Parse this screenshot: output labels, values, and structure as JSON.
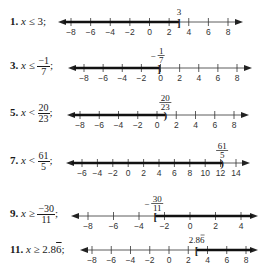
{
  "problems": [
    {
      "number": "1.",
      "variable": "x",
      "relation": "≤",
      "value_text": "3",
      "value_frac": null,
      "boundary": 3,
      "boundary_label": "3",
      "boundary_label_frac": null,
      "bracket": "]",
      "direction": "left",
      "ticks": [
        -8,
        -6,
        -4,
        -2,
        0,
        2,
        4,
        6,
        8
      ],
      "tick_labels": [
        "−8",
        "−6",
        "−4",
        "−2",
        "0",
        "2",
        "4",
        "6",
        "8"
      ]
    },
    {
      "number": "3.",
      "variable": "x",
      "relation": "≤",
      "value_text": null,
      "value_frac": {
        "num": "−1",
        "den": "7"
      },
      "boundary": -0.142857,
      "boundary_label": null,
      "boundary_label_frac": {
        "sign": "−",
        "num": "1",
        "den": "7"
      },
      "bracket": "]",
      "direction": "left",
      "ticks": [
        -8,
        -6,
        -4,
        -2,
        0,
        2,
        4,
        6,
        8
      ],
      "tick_labels": [
        "−8",
        "−6",
        "−4",
        "−2",
        "0",
        "2",
        "4",
        "6",
        "8"
      ]
    },
    {
      "number": "5.",
      "variable": "x",
      "relation": "<",
      "value_text": null,
      "value_frac": {
        "num": "20",
        "den": "23"
      },
      "boundary": 0.869565,
      "boundary_label": null,
      "boundary_label_frac": {
        "sign": "",
        "num": "20",
        "den": "23"
      },
      "bracket": ")",
      "direction": "left",
      "ticks": [
        -8,
        -6,
        -4,
        -2,
        0,
        2,
        4,
        6,
        8
      ],
      "tick_labels": [
        "−8",
        "−6",
        "−4",
        "−2",
        "0",
        "2",
        "4",
        "6",
        "8"
      ]
    },
    {
      "number": "7.",
      "variable": "x",
      "relation": "<",
      "value_text": null,
      "value_frac": {
        "num": "61",
        "den": "5"
      },
      "boundary": 12.2,
      "boundary_label": null,
      "boundary_label_frac": {
        "sign": "",
        "num": "61",
        "den": "5"
      },
      "bracket": ")",
      "direction": "left",
      "ticks": [
        -6,
        -4,
        -2,
        0,
        2,
        4,
        6,
        8,
        10,
        12,
        14
      ],
      "tick_labels": [
        "−6",
        "−4",
        "−2",
        "0",
        "2",
        "4",
        "6",
        "8",
        "10",
        "12",
        "14"
      ]
    },
    {
      "number": "9.",
      "variable": "x",
      "relation": "≥",
      "value_text": null,
      "value_frac": {
        "num": "−30",
        "den": "11"
      },
      "boundary": -2.727273,
      "boundary_label": null,
      "boundary_label_frac": {
        "sign": "−",
        "num": "30",
        "den": "11"
      },
      "bracket": "[",
      "direction": "right",
      "ticks": [
        -8,
        -6,
        -4,
        -2,
        0,
        2,
        4
      ],
      "tick_labels": [
        "−8",
        "−6",
        "−4",
        "−2",
        "0",
        "2",
        "4"
      ]
    },
    {
      "number": "11.",
      "variable": "x",
      "relation": "≥",
      "value_text": "2.86",
      "value_repeat": "6",
      "value_frac": null,
      "boundary": 2.8667,
      "boundary_label": "2.86",
      "boundary_label_frac": null,
      "bracket": "[",
      "direction": "right",
      "ticks": [
        -8,
        -6,
        -4,
        -2,
        0,
        2,
        4,
        6,
        8
      ],
      "tick_labels": [
        "−8",
        "−6",
        "−4",
        "−2",
        "0",
        "2",
        "4",
        "6",
        "8"
      ]
    }
  ],
  "layout": [
    {
      "top": 0,
      "label_left": 10,
      "label_top": 14,
      "line_y": 22,
      "x0": 58,
      "x1": 243,
      "t0": 71,
      "t1": 228
    },
    {
      "top": 45,
      "label_left": 10,
      "label_top": 50,
      "line_y": 23,
      "x0": 68,
      "x1": 252,
      "t0": 84,
      "t1": 237
    },
    {
      "top": 90,
      "label_left": 10,
      "label_top": 50,
      "line_y": 25,
      "x0": 67,
      "x1": 249,
      "t0": 80,
      "t1": 234
    },
    {
      "top": 135,
      "label_left": 10,
      "label_top": 50,
      "line_y": 28,
      "x0": 66,
      "x1": 250,
      "t0": 82,
      "t1": 236
    },
    {
      "top": 185,
      "label_left": 10,
      "label_top": 50,
      "line_y": 31,
      "x0": 71,
      "x1": 258,
      "t0": 88,
      "t1": 241
    },
    {
      "top": 235,
      "label_left": 10,
      "label_top": 50,
      "line_y": 15,
      "x0": 80,
      "x1": 258,
      "t0": 92,
      "t1": 246
    }
  ]
}
